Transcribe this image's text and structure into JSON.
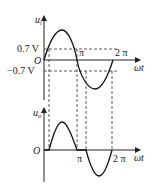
{
  "diagram": {
    "top_graph": {
      "y_axis_label": "u",
      "y_axis_sub": "i",
      "x_axis_label": "ωt",
      "origin_label": "O",
      "upper_threshold_label": "0.7 V",
      "lower_threshold_label": "−0.7 V",
      "pi_label": "π",
      "two_pi_label": "2 π"
    },
    "bottom_graph": {
      "y_axis_label": "u",
      "y_axis_sub": "o",
      "x_axis_label": "ωt",
      "origin_label": "O",
      "pi_label": "π",
      "two_pi_label": "2 π"
    }
  }
}
